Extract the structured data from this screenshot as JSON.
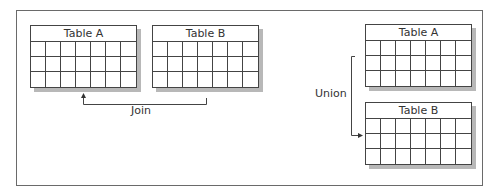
{
  "diagram": {
    "join": {
      "label": "Join",
      "tables": [
        {
          "name": "Table A",
          "columns": 7,
          "rows": 3
        },
        {
          "name": "Table B",
          "columns": 7,
          "rows": 3
        }
      ]
    },
    "union": {
      "label": "Union",
      "tables": [
        {
          "name": "Table A",
          "columns": 7,
          "rows": 3
        },
        {
          "name": "Table B",
          "columns": 7,
          "rows": 3
        }
      ]
    },
    "colors": {
      "line": "#444444",
      "shadow": "#b8b8b8",
      "frame": "#6a6a6a"
    }
  }
}
